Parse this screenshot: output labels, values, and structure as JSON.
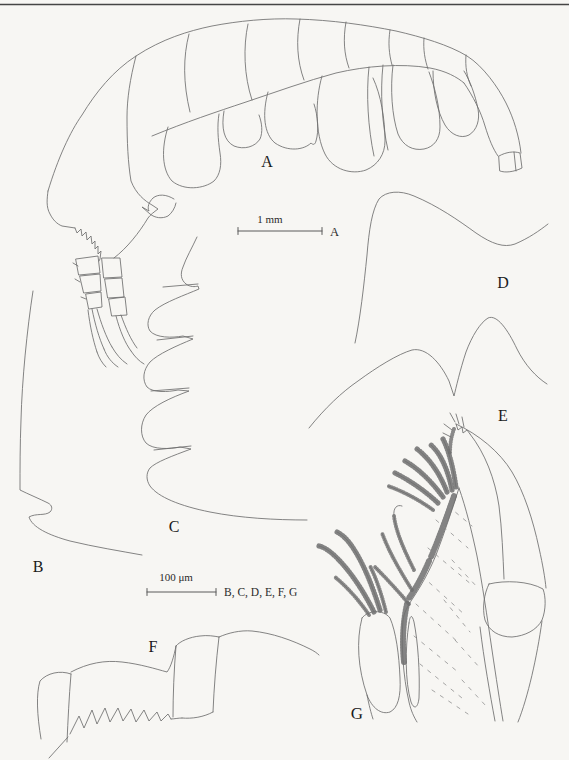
{
  "colors": {
    "background": "#f7f6f3",
    "ink": "#6e6e6e",
    "label_text": "#1b1b1b",
    "top_rule": "#454545"
  },
  "panels": {
    "a": {
      "label": "A"
    },
    "b": {
      "label": "B"
    },
    "c": {
      "label": "C"
    },
    "d": {
      "label": "D"
    },
    "e": {
      "label": "E"
    },
    "f": {
      "label": "F"
    },
    "g": {
      "label": "G"
    }
  },
  "scale_bars": {
    "mm": {
      "caption": "1 mm",
      "applies_to": "A"
    },
    "um": {
      "caption": "100 μm",
      "applies_to": "B, C, D, E, F, G"
    }
  }
}
